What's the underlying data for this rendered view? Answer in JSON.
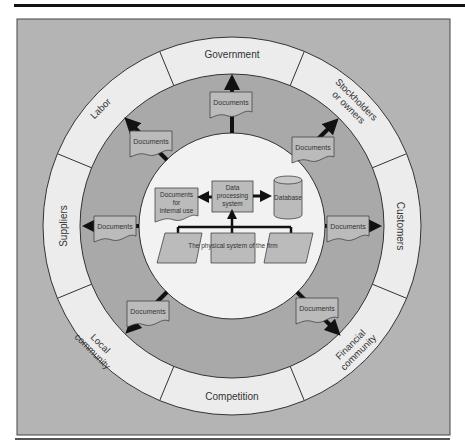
{
  "colors": {
    "background_gray": "#b4b4b4",
    "ring_light": "#ececec",
    "inner_gray": "#a9a9a9",
    "center_white": "#f2f2f2",
    "box_gray": "#b9b9b9",
    "arrow": "#111111"
  },
  "environment": {
    "sectors": [
      {
        "label": "Government"
      },
      {
        "label_line1": "Stockholders",
        "label_line2": "or owners"
      },
      {
        "label": "Customers"
      },
      {
        "label_line1": "Financial",
        "label_line2": "community"
      },
      {
        "label": "Competition"
      },
      {
        "label_line1": "Local",
        "label_line2": "community"
      },
      {
        "label": "Suppliers"
      },
      {
        "label": "Labor"
      }
    ]
  },
  "documents": {
    "label": "Documents",
    "count": 7
  },
  "firm": {
    "internal_docs_line1": "Documents",
    "internal_docs_line2": "for",
    "internal_docs_line3": "internal use",
    "dps_line1": "Data",
    "dps_line2": "processing",
    "dps_line3": "system",
    "database": "Database",
    "physical_system": "The physical system of the firm"
  }
}
